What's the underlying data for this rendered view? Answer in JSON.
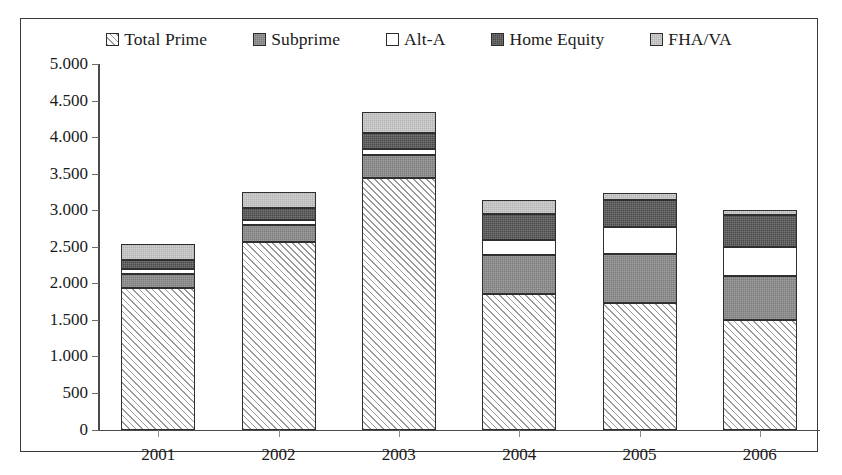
{
  "chart_data": {
    "type": "bar",
    "stacked": true,
    "title": "",
    "subtitle": "",
    "xlabel": "",
    "ylabel": "",
    "grid": false,
    "legend_position": "top-center",
    "categories": [
      "2001",
      "2002",
      "2003",
      "2004",
      "2005",
      "2006"
    ],
    "ylim": [
      0,
      5000
    ],
    "ytick_labels": [
      "0",
      "500",
      "1.000",
      "1.500",
      "2.000",
      "2.500",
      "3.000",
      "3.500",
      "4.000",
      "4.500",
      "5.000"
    ],
    "ytick_values": [
      0,
      500,
      1000,
      1500,
      2000,
      2500,
      3000,
      3500,
      4000,
      4500,
      5000
    ],
    "series": [
      {
        "name": "Total Prime",
        "swatch": "diagonal-hatch",
        "color": "#ffffff",
        "values": [
          1940,
          2570,
          3440,
          1850,
          1730,
          1500
        ]
      },
      {
        "name": "Subprime",
        "swatch": "medium-gray",
        "color": "#7d7d7d",
        "values": [
          190,
          230,
          310,
          540,
          665,
          600
        ]
      },
      {
        "name": "Alt-A",
        "swatch": "white",
        "color": "#ffffff",
        "values": [
          60,
          70,
          85,
          200,
          380,
          400
        ]
      },
      {
        "name": "Home Equity",
        "swatch": "dark-gray",
        "color": "#4a4a4a",
        "values": [
          130,
          165,
          220,
          355,
          360,
          430
        ]
      },
      {
        "name": "FHA/VA",
        "swatch": "light-gray",
        "color": "#b4b4b4",
        "values": [
          215,
          215,
          290,
          195,
          105,
          75
        ]
      }
    ],
    "totals": [
      2535,
      3250,
      4345,
      3140,
      3240,
      3005
    ]
  },
  "legend": {
    "items": [
      {
        "label": "Total Prime"
      },
      {
        "label": "Subprime"
      },
      {
        "label": "Alt-A"
      },
      {
        "label": "Home Equity"
      },
      {
        "label": "FHA/VA"
      }
    ]
  }
}
